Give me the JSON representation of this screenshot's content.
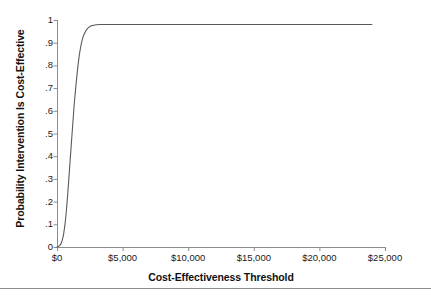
{
  "chart_data": {
    "type": "line",
    "title": "",
    "xlabel": "Cost-Effectiveness Threshold",
    "ylabel": "Probability Intervention Is Cost-Effective",
    "xlim": [
      0,
      25000
    ],
    "ylim": [
      0,
      1
    ],
    "grid": false,
    "legend": "none",
    "xticks": [
      0,
      5000,
      10000,
      15000,
      20000,
      25000
    ],
    "xticklabels": [
      "$0",
      "$5,000",
      "$10,000",
      "$15,000",
      "$20,000",
      "$25,000"
    ],
    "yticks": [
      0,
      0.1,
      0.2,
      0.3,
      0.4,
      0.5,
      0.6,
      0.7,
      0.8,
      0.9,
      1
    ],
    "yticklabels": [
      "0",
      ".1",
      ".2",
      ".3",
      ".4",
      ".5",
      ".6",
      ".7",
      ".8",
      ".9",
      "1"
    ],
    "series": [
      {
        "name": "Cost-effectiveness acceptability curve",
        "color": "#5a5a5a",
        "x": [
          0,
          100,
          200,
          300,
          400,
          500,
          600,
          700,
          800,
          900,
          1000,
          1100,
          1200,
          1300,
          1400,
          1500,
          1600,
          1700,
          1800,
          1900,
          2000,
          2200,
          2400,
          2600,
          2800,
          3000,
          3300,
          3600,
          4000,
          5000,
          6000,
          8000,
          10000,
          12000,
          14000,
          16000,
          18000,
          20000,
          22000,
          24000
        ],
        "values": [
          0,
          0.002,
          0.006,
          0.014,
          0.03,
          0.055,
          0.095,
          0.15,
          0.22,
          0.3,
          0.38,
          0.46,
          0.54,
          0.62,
          0.685,
          0.745,
          0.8,
          0.845,
          0.88,
          0.908,
          0.928,
          0.953,
          0.967,
          0.974,
          0.977,
          0.979,
          0.98,
          0.98,
          0.98,
          0.98,
          0.98,
          0.98,
          0.98,
          0.98,
          0.98,
          0.98,
          0.98,
          0.98,
          0.98,
          0.98
        ]
      }
    ],
    "annotations": []
  },
  "axes": {
    "y_title": "Probability Intervention Is Cost-Effective",
    "x_title": "Cost-Effectiveness Threshold",
    "axis_color": "#8c8c8c",
    "line_color": "#5a5a5a"
  },
  "figure": {
    "background": "#ffffff",
    "rule_color": "#8c8c8c"
  }
}
